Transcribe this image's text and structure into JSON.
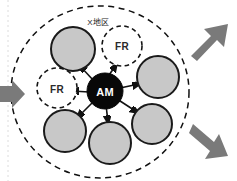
{
  "diagram": {
    "title_label": "X地区",
    "center_node": {
      "label": "AM",
      "shape": "circle",
      "fill": "#080808",
      "stroke": "#080808",
      "text_color": "#ffffff"
    },
    "region_boundary": {
      "name": "outer-dashed-region",
      "shape": "circle",
      "style": "dashed",
      "stroke": "#101010",
      "fill": "#ffffff"
    },
    "member_nodes": [
      {
        "label": "",
        "type": "filled",
        "fill": "#c8c8c8",
        "stroke": "#1a1a1a",
        "position": "upper-left"
      },
      {
        "label": "",
        "type": "filled",
        "fill": "#c8c8c8",
        "stroke": "#1a1a1a",
        "position": "right-upper"
      },
      {
        "label": "",
        "type": "filled",
        "fill": "#c8c8c8",
        "stroke": "#1a1a1a",
        "position": "right-lower"
      },
      {
        "label": "",
        "type": "filled",
        "fill": "#c8c8c8",
        "stroke": "#1a1a1a",
        "position": "bottom"
      },
      {
        "label": "",
        "type": "filled",
        "fill": "#c8c8c8",
        "stroke": "#1a1a1a",
        "position": "lower-left"
      }
    ],
    "fr_nodes": [
      {
        "label": "FR",
        "type": "dashed",
        "fill": "#ffffff",
        "stroke": "#141414",
        "position": "top"
      },
      {
        "label": "FR",
        "type": "dashed",
        "fill": "#ffffff",
        "stroke": "#141414",
        "position": "left"
      }
    ],
    "flow_arrows": [
      {
        "name": "inbound-arrow-left",
        "direction": "right",
        "color": "#7a7a7a"
      },
      {
        "name": "outbound-arrow-top-right",
        "direction": "up-right",
        "color": "#7a7a7a"
      },
      {
        "name": "outbound-arrow-bottom-right",
        "direction": "down-right",
        "color": "#7a7a7a"
      }
    ],
    "connector_arrows": {
      "name": "am-to-node-connectors",
      "color": "#121212",
      "count": 7,
      "style": "double-headed-short"
    },
    "colors": {
      "background": "#ffffff",
      "node_gray": "#c8c8c8",
      "node_outline": "#1a1a1a",
      "center_black": "#080808",
      "arrow_gray": "#7a7a7a",
      "edge_guide": "#d8d8d8"
    }
  }
}
